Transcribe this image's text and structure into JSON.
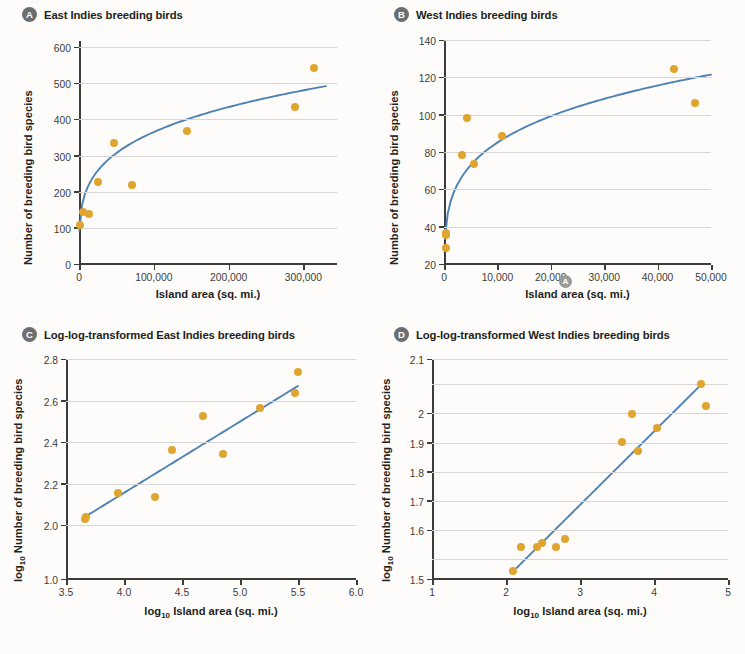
{
  "figure": {
    "marker_color": "#e0a430",
    "line_color": "#4e82b4",
    "axis_color": "#3c3c3b",
    "gridline_color": "#d6d6d6",
    "badge_color": "#6d6e70"
  },
  "panels": {
    "a": {
      "letter": "A",
      "title": "East Indies breeding birds",
      "xlabel": "Island area (sq. mi.)",
      "ylabel": "Number of breeding bird species",
      "yticks": [
        "0",
        "100",
        "200",
        "300",
        "400",
        "500",
        "600"
      ],
      "xticks": [
        "0",
        "100,000",
        "200,000",
        "300,000"
      ]
    },
    "b": {
      "letter": "B",
      "title": "West Indies breeding birds",
      "xlabel": "Island area (sq. mi.)",
      "ylabel": "Number of breeding bird species",
      "yticks": [
        "20",
        "40",
        "60",
        "80",
        "100",
        "120",
        "140"
      ],
      "xticks": [
        "0",
        "10,000",
        "20,000",
        "30,000",
        "40,000",
        "50,000"
      ],
      "axis_marker": "A"
    },
    "c": {
      "letter": "C",
      "title": "Log-log-transformed East Indies breeding birds",
      "xlabel_prefix": "log",
      "xlabel_sub": "10",
      "xlabel_rest": " Island area (sq. mi.)",
      "ylabel_prefix": "log",
      "ylabel_sub": "10",
      "ylabel_rest": " Number of breeding bird species",
      "yticks": [
        "1.0",
        "2.0",
        "2.2",
        "2.4",
        "2.6",
        "2.8"
      ],
      "xticks": [
        "3.5",
        "4.0",
        "4.5",
        "5.0",
        "5.5",
        "6.0"
      ]
    },
    "d": {
      "letter": "D",
      "title": "Log-log-transformed West Indies breeding birds",
      "xlabel_prefix": "log",
      "xlabel_sub": "10",
      "xlabel_rest": " Island area (sq. mi.)",
      "ylabel_prefix": "log",
      "ylabel_sub": "10",
      "ylabel_rest": " Number of breeding bird species",
      "yticks": [
        "0",
        "1.5",
        "1.6",
        "1.7",
        "1.8",
        "1.9",
        "2.0",
        "2.1",
        "2.0"
      ],
      "xticks": [
        "1",
        "2",
        "3",
        "4",
        "5"
      ]
    }
  },
  "chart_data": [
    {
      "type": "scatter",
      "panel": "A",
      "title": "East Indies breeding birds",
      "xlabel": "Island area (sq. mi.)",
      "ylabel": "Number of breeding bird species",
      "xlim": [
        0,
        345000
      ],
      "ylim": [
        0,
        620
      ],
      "xticks": [
        0,
        100000,
        200000,
        300000
      ],
      "yticks": [
        0,
        100,
        200,
        300,
        400,
        500,
        600
      ],
      "grid": true,
      "points": [
        {
          "x": 2000,
          "y": 111
        },
        {
          "x": 5500,
          "y": 146
        },
        {
          "x": 14000,
          "y": 140
        },
        {
          "x": 25000,
          "y": 231
        },
        {
          "x": 47000,
          "y": 337
        },
        {
          "x": 71000,
          "y": 221
        },
        {
          "x": 144000,
          "y": 371
        },
        {
          "x": 289000,
          "y": 436
        },
        {
          "x": 314000,
          "y": 545
        }
      ],
      "fit": {
        "kind": "power",
        "note": "S = c*A^z curved fit rising from origin to ~495 at 330,000"
      }
    },
    {
      "type": "scatter",
      "panel": "B",
      "title": "West Indies breeding birds",
      "xlabel": "Island area (sq. mi.)",
      "ylabel": "Number of breeding bird species",
      "xlim": [
        0,
        50000
      ],
      "ylim": [
        20,
        140
      ],
      "xticks": [
        0,
        10000,
        20000,
        30000,
        40000,
        50000
      ],
      "yticks": [
        20,
        40,
        60,
        80,
        100,
        120,
        140
      ],
      "grid": true,
      "points": [
        {
          "x": 300,
          "y": 29
        },
        {
          "x": 300,
          "y": 36
        },
        {
          "x": 400,
          "y": 37
        },
        {
          "x": 3400,
          "y": 79
        },
        {
          "x": 4400,
          "y": 99
        },
        {
          "x": 5600,
          "y": 74
        },
        {
          "x": 10800,
          "y": 89
        },
        {
          "x": 43000,
          "y": 125
        },
        {
          "x": 47000,
          "y": 107
        }
      ],
      "fit": {
        "kind": "power",
        "note": "curved fit rising steeply from ~38 near 0 to ~122 at 50,000"
      }
    },
    {
      "type": "scatter",
      "panel": "C",
      "title": "Log-log-transformed East Indies breeding birds",
      "xlabel": "log10 Island area (sq. mi.)",
      "ylabel": "log10 Number of breeding bird species",
      "xlim": [
        3.5,
        6.0
      ],
      "ylim": [
        1.0,
        2.8
      ],
      "xticks": [
        3.5,
        4.0,
        4.5,
        5.0,
        5.5,
        6.0
      ],
      "yticks": [
        1.0,
        2.0,
        2.2,
        2.4,
        2.6,
        2.8
      ],
      "broken_yaxis": true,
      "grid": true,
      "points": [
        {
          "x": 3.66,
          "y": 2.035
        },
        {
          "x": 3.67,
          "y": 2.045
        },
        {
          "x": 3.95,
          "y": 2.16
        },
        {
          "x": 4.27,
          "y": 2.14
        },
        {
          "x": 4.41,
          "y": 2.365
        },
        {
          "x": 4.68,
          "y": 2.53
        },
        {
          "x": 4.85,
          "y": 2.345
        },
        {
          "x": 5.17,
          "y": 2.57
        },
        {
          "x": 5.47,
          "y": 2.64
        },
        {
          "x": 5.5,
          "y": 2.74
        }
      ],
      "fit": {
        "kind": "linear",
        "x0": 3.65,
        "y0": 2.04,
        "x1": 5.5,
        "y1": 2.675
      }
    },
    {
      "type": "scatter",
      "panel": "D",
      "title": "Log-log-transformed West Indies breeding birds",
      "xlabel": "log10 Island area (sq. mi.)",
      "ylabel": "log10 Number of breeding bird species",
      "xlim": [
        1,
        5
      ],
      "ylim": [
        1.45,
        2.2
      ],
      "xticks": [
        1,
        2,
        3,
        4,
        5
      ],
      "yticks": [
        1.5,
        1.6,
        1.7,
        1.8,
        1.9,
        2.0,
        2.1
      ],
      "broken_yaxis": true,
      "grid": true,
      "points": [
        {
          "x": 2.09,
          "y": 1.463
        },
        {
          "x": 2.2,
          "y": 1.545
        },
        {
          "x": 2.42,
          "y": 1.545
        },
        {
          "x": 2.48,
          "y": 1.558
        },
        {
          "x": 2.68,
          "y": 1.545
        },
        {
          "x": 2.8,
          "y": 1.572
        },
        {
          "x": 3.57,
          "y": 1.905
        },
        {
          "x": 3.7,
          "y": 2.0
        },
        {
          "x": 3.78,
          "y": 1.873
        },
        {
          "x": 4.04,
          "y": 1.953
        },
        {
          "x": 4.64,
          "y": 2.105
        },
        {
          "x": 4.7,
          "y": 2.03
        }
      ],
      "fit": {
        "kind": "linear",
        "x0": 2.07,
        "y0": 1.455,
        "x1": 4.66,
        "y1": 2.108
      }
    }
  ]
}
